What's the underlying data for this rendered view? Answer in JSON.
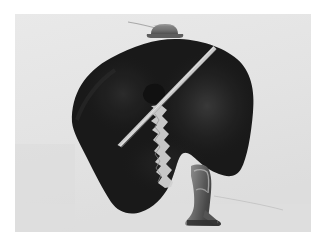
{
  "image": {
    "title": "Black silhouette figure with hat, pole and boot",
    "medium": "photograph",
    "orientation": "landscape",
    "width_px": 326,
    "height_px": 247
  },
  "frame": {
    "outer_background_color": "#ffffff",
    "photo_background_color": "#e3e3e3",
    "photo_left": 15,
    "photo_top": 14,
    "photo_width": 296,
    "photo_height": 218
  },
  "palette": {
    "silhouette_black": "#0d0d0d",
    "silhouette_black_soft": "#141414",
    "highlight_sheen": "#2a2a2a",
    "pole_light": "#c9c9c9",
    "pole_bright": "#e8e8e8",
    "hat_gray": "#6e6e6e",
    "hat_gray_dark": "#4a4a4a",
    "boot_mid_gray": "#7a7a7a",
    "boot_dark_gray": "#3a3a3a",
    "boot_light_gray": "#b4b4b4",
    "thin_wire_gray": "#bdbdbd",
    "backdrop_gray": "#e3e3e3",
    "backdrop_gray_shadow": "#d8d8d8"
  },
  "elements": {
    "silhouette": {
      "name": "large black silhouette mass",
      "description": "Large irregular black shape occupying the center of the frame, resembling a hooded figure or draped form"
    },
    "hat": {
      "name": "small gray hat",
      "description": "Small flat-topped gray cap resting on the crest of the black mass near the top center"
    },
    "antenna": {
      "name": "thin wire above hat",
      "description": "Very thin light line rising to the upper left from the hat"
    },
    "pole": {
      "name": "diagonal light pole",
      "description": "Pale narrow stick running diagonally from upper right down to lower left across the black mass"
    },
    "profile_notch": {
      "name": "white profile notch",
      "description": "Narrow jagged light gap in the black mass forming a face-like profile edge in the lower middle"
    },
    "boot": {
      "name": "high heeled boot",
      "description": "Small gray high-heeled boot hanging below the black mass at lower center right"
    },
    "wire": {
      "name": "thin diagonal wire",
      "description": "Faint thin line extending to the right from the boot toward the right edge of the photo"
    }
  },
  "chart_data": null
}
